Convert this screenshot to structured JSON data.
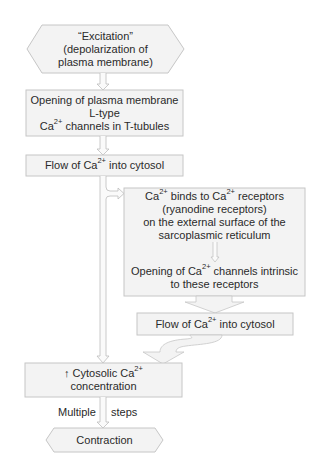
{
  "diagram": {
    "colors": {
      "box_fill": "#f3f3f3",
      "box_stroke": "#c6c6c6",
      "arrow_fill": "#f3f3f3",
      "arrow_stroke": "#bdbdbd",
      "text": "#2a2a2a"
    },
    "nodes": {
      "excitation": {
        "shape": "hexagon",
        "lines": [
          "“Excitation”",
          "(depolarization of",
          "plasma membrane)"
        ]
      },
      "l_type_opening": {
        "shape": "rectangle",
        "lines": [
          "Opening of plasma membrane",
          "L-type"
        ],
        "line3_pre": "Ca",
        "line3_sup": "2+",
        "line3_post": " channels in T-tubules"
      },
      "flow_1": {
        "shape": "rectangle",
        "pre": "Flow of Ca",
        "sup": "2+",
        "post": " into cytosol"
      },
      "ryanodine_box": {
        "shape": "rectangle",
        "binds": {
          "pre": "Ca",
          "sup1": "2+",
          "mid": " binds to Ca",
          "sup2": "2+",
          "post": " receptors"
        },
        "lines": [
          "(ryanodine receptors)",
          "on the external surface of the",
          "sarcoplasmic reticulum"
        ],
        "opening": {
          "pre": "Opening of Ca",
          "sup": "2+",
          "post": " channels intrinsic",
          "line2": "to these receptors"
        }
      },
      "flow_2": {
        "shape": "rectangle",
        "pre": "Flow of Ca",
        "sup": "2+",
        "post": " into cytosol"
      },
      "cytosolic_conc": {
        "shape": "rectangle",
        "pre": "↑ Cytosolic Ca",
        "sup": "2+",
        "line2": "concentration"
      },
      "contraction": {
        "shape": "hexagon",
        "label": "Contraction"
      }
    },
    "edge_labels": {
      "left": "Multiple",
      "right": "steps"
    }
  }
}
